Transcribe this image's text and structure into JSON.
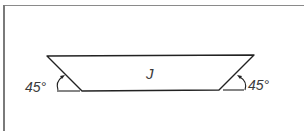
{
  "diagram": {
    "type": "trapezoid",
    "shape_label": "J",
    "angles": [
      {
        "position": "bottom-left",
        "label": "45°"
      },
      {
        "position": "bottom-right",
        "label": "45°"
      }
    ],
    "vertices": {
      "top_left": [
        47,
        56
      ],
      "top_right": [
        254,
        55
      ],
      "bottom_right": [
        219,
        90
      ],
      "bottom_left": [
        82,
        91
      ]
    },
    "colors": {
      "stroke": "#222222",
      "frame": "#8a8a8a",
      "background": "#ffffff"
    }
  }
}
